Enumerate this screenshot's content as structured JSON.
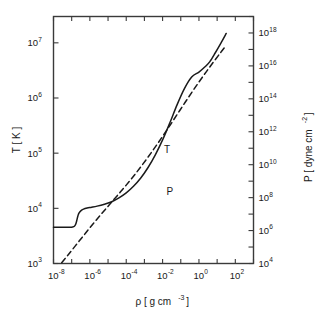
{
  "chart_data": {
    "type": "line",
    "title": "",
    "xlabel": "ρ [ g cm⁻³ ]",
    "xlabel_base": "ρ  [ g cm",
    "xlabel_exp": "-3",
    "xlabel_tail": "]",
    "ylabel_left": "T [ K ]",
    "ylabel_right": "P [ dyne cm⁻² ]",
    "ylabel_right_base": "P  [ dyne cm",
    "ylabel_right_exp": "-2",
    "ylabel_right_tail": "]",
    "xscale": "log",
    "yscale": "log",
    "xlim": [
      1e-08,
      1000
    ],
    "ylim_left": [
      1000,
      30000000
    ],
    "ylim_right": [
      10000,
      1e+19
    ],
    "grid": false,
    "legend": "inline-annotations",
    "x_ticks_labeled": [
      "-8",
      "-6",
      "-4",
      "-2",
      "0",
      "2"
    ],
    "x_tick_mantissa": "10",
    "y_left_ticks_labeled": [
      "3",
      "4",
      "5",
      "6",
      "7"
    ],
    "y_right_ticks_labeled": [
      "4",
      "6",
      "8",
      "10",
      "12",
      "14",
      "16",
      "18"
    ],
    "annotations": [
      {
        "text": "T",
        "x_log": -1.75,
        "y_log": 5.0,
        "series": "T"
      },
      {
        "text": "P",
        "x_log": -1.6,
        "y_log": 4.25,
        "series": "P"
      }
    ],
    "series": [
      {
        "name": "T",
        "label": "T",
        "style": "solid",
        "color": "#1a1a1a",
        "axis": "left",
        "x_log": [
          -8.0,
          -7.6,
          -7.3,
          -7.1,
          -6.95,
          -6.85,
          -6.78,
          -6.72,
          -6.66,
          -6.6,
          -6.5,
          -6.35,
          -6.15,
          -5.9,
          -5.6,
          -5.2,
          -4.8,
          -4.4,
          -4.0,
          -3.6,
          -3.2,
          -2.8,
          -2.4,
          -2.0,
          -1.6,
          -1.2,
          -0.8,
          -0.4,
          0.0,
          0.35,
          0.6,
          0.9,
          1.2,
          1.5
        ],
        "y_log": [
          3.655,
          3.655,
          3.655,
          3.657,
          3.662,
          3.675,
          3.71,
          3.78,
          3.86,
          3.915,
          3.955,
          3.985,
          4.005,
          4.02,
          4.04,
          4.075,
          4.12,
          4.19,
          4.28,
          4.4,
          4.55,
          4.74,
          4.97,
          5.24,
          5.55,
          5.88,
          6.17,
          6.38,
          6.47,
          6.57,
          6.66,
          6.82,
          6.99,
          7.17
        ]
      },
      {
        "name": "P",
        "label": "P",
        "style": "dashed",
        "color": "#1a1a1a",
        "axis": "right",
        "x_log": [
          -7.55,
          -7.2,
          -6.8,
          -6.4,
          -6.0,
          -5.6,
          -5.2,
          -4.8,
          -4.4,
          -4.0,
          -3.6,
          -3.2,
          -2.8,
          -2.4,
          -2.0,
          -1.6,
          -1.2,
          -0.8,
          -0.4,
          0.0,
          0.4,
          0.8,
          1.2,
          1.5
        ],
        "y_log": [
          4.05,
          4.52,
          5.07,
          5.62,
          6.17,
          6.7,
          7.22,
          7.73,
          8.24,
          8.76,
          9.3,
          9.87,
          10.46,
          11.08,
          11.72,
          12.38,
          13.05,
          13.72,
          14.38,
          15.02,
          15.64,
          16.24,
          16.82,
          17.25
        ]
      }
    ]
  },
  "figure": {
    "background_color": "#ffffff",
    "axis_color": "#3a3a3a",
    "line_color": "#1a1a1a"
  }
}
